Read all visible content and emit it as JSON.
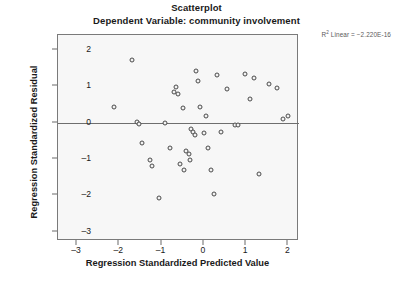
{
  "chart_data": {
    "type": "scatter",
    "title": "Scatterplot",
    "subtitle": "Dependent Variable: community involvement",
    "xlabel": "Regression Standardized Predicted Value",
    "ylabel": "Regression Standardized Residual",
    "annotation": "R² Linear = −2.220E-16",
    "annotation_prefix": "R",
    "annotation_sup": "2",
    "annotation_rest": " Linear = −2.220E-16",
    "xlim": [
      -3.45,
      2.25
    ],
    "ylim": [
      -3.25,
      2.4
    ],
    "xticks": [
      -3,
      -2,
      -1,
      0,
      1,
      2
    ],
    "xtick_labels": [
      "–3",
      "–2",
      "–1",
      "0",
      "1",
      "2"
    ],
    "yticks": [
      2,
      1,
      0,
      -1,
      -2,
      -3
    ],
    "ytick_labels": [
      "2",
      "1",
      "0",
      "–1",
      "–2",
      "–3"
    ],
    "grid": false,
    "legend": "none",
    "reference_line_y": 0,
    "marker": "open-circle",
    "marker_color": "#4a4a4a",
    "plot_background": "#f7f7f7",
    "frame_color": "#7a7a7a",
    "n_points": 40,
    "points": [
      [
        -1.7,
        1.72
      ],
      [
        -2.13,
        0.42
      ],
      [
        -1.59,
        0.01
      ],
      [
        -1.53,
        -0.04
      ],
      [
        -1.47,
        -0.57
      ],
      [
        -1.28,
        -1.03
      ],
      [
        -1.22,
        -1.19
      ],
      [
        -1.07,
        -2.06
      ],
      [
        -0.91,
        0.0
      ],
      [
        -0.79,
        -0.69
      ],
      [
        -0.7,
        0.84
      ],
      [
        -0.66,
        0.97
      ],
      [
        -0.61,
        0.78
      ],
      [
        -0.56,
        -1.14
      ],
      [
        -0.5,
        0.41
      ],
      [
        -0.47,
        -1.3
      ],
      [
        -0.42,
        -0.78
      ],
      [
        -0.36,
        -0.87
      ],
      [
        -0.33,
        -1.04
      ],
      [
        -0.3,
        -0.18
      ],
      [
        -0.26,
        -0.25
      ],
      [
        -0.21,
        -0.33
      ],
      [
        -0.19,
        1.42
      ],
      [
        -0.13,
        1.15
      ],
      [
        -0.08,
        0.43
      ],
      [
        0.0,
        -0.3
      ],
      [
        0.04,
        0.17
      ],
      [
        0.1,
        -0.71
      ],
      [
        0.17,
        -1.3
      ],
      [
        0.23,
        -1.95
      ],
      [
        0.3,
        1.3
      ],
      [
        0.4,
        -0.25
      ],
      [
        0.55,
        0.92
      ],
      [
        0.74,
        -0.08
      ],
      [
        0.8,
        -0.06
      ],
      [
        0.98,
        1.33
      ],
      [
        1.08,
        0.65
      ],
      [
        1.18,
        1.22
      ],
      [
        1.3,
        -1.42
      ],
      [
        1.55,
        1.05
      ],
      [
        1.72,
        0.95
      ],
      [
        1.86,
        0.1
      ],
      [
        2.0,
        0.18
      ]
    ]
  }
}
